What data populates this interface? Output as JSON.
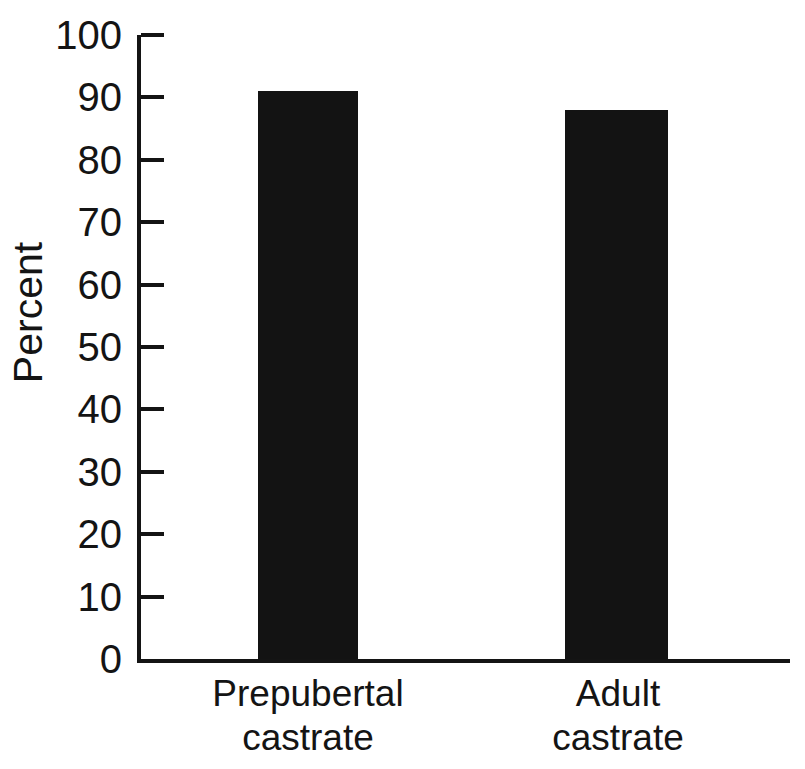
{
  "chart_data": {
    "type": "bar",
    "title": "",
    "subtitle": "",
    "xlabel": "",
    "ylabel": "Percent",
    "categories": [
      "Prepubertal castrate",
      "Adult castrate"
    ],
    "category_lines": [
      [
        "Prepubertal",
        "castrate"
      ],
      [
        "Adult",
        "castrate"
      ]
    ],
    "values": [
      91,
      88
    ],
    "ylim": [
      0,
      100
    ],
    "ytick_step": 10,
    "yticks": [
      100,
      90,
      80,
      70,
      60,
      50,
      40,
      30,
      20,
      10,
      0
    ],
    "ytick_labels": [
      "100",
      "90",
      "80",
      "70",
      "60",
      "50",
      "40",
      "30",
      "20",
      "10",
      "0"
    ],
    "xticks": [],
    "grid": false,
    "legend": null,
    "legend_position": "none",
    "annotations": [],
    "series": [
      {
        "name": "Percent",
        "values": [
          91,
          88
        ]
      }
    ]
  },
  "style": {
    "background_color": "#ffffff",
    "bar_color": "#131313",
    "axis_color": "#141414",
    "text_color": "#141414"
  },
  "geometry": {
    "axis_left_px": 137,
    "axis_top_px": 35,
    "axis_baseline_px": 659,
    "axis_right_px": 790,
    "bars": [
      {
        "left_px": 258,
        "width_px": 100,
        "label_left_px": 198,
        "label_width_px": 220
      },
      {
        "left_px": 565,
        "width_px": 103,
        "label_left_px": 508,
        "label_width_px": 220
      }
    ]
  }
}
